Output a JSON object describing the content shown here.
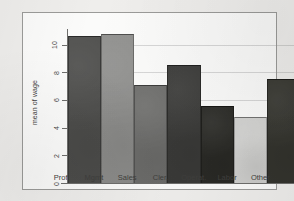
{
  "chart_data": {
    "type": "bar",
    "title": "",
    "xlabel": "",
    "ylabel": "mean of wage",
    "categories": [
      "Prof",
      "Mgmt",
      "Sales",
      "Cler.",
      "Operat.",
      "Labor",
      "Other"
    ],
    "values": [
      10.6,
      10.8,
      7.1,
      8.5,
      5.6,
      4.8,
      7.5
    ],
    "bar_colors": [
      "#4e4e4c",
      "#8f8f8d",
      "#6e6e6c",
      "#3b3b39",
      "#2a2a26",
      "#d2d2d0",
      "#35352f"
    ],
    "ylim": [
      0,
      11.2
    ],
    "yticks": [
      0,
      2,
      4,
      6,
      8,
      10
    ],
    "ytick_labels": [
      "0",
      "2",
      "4",
      "6",
      "8",
      "10"
    ],
    "grid": true,
    "legend": "none",
    "axis_color": "#6e6e6c",
    "panel_background": "#fbfbfa",
    "page_background": "#efeeec"
  }
}
